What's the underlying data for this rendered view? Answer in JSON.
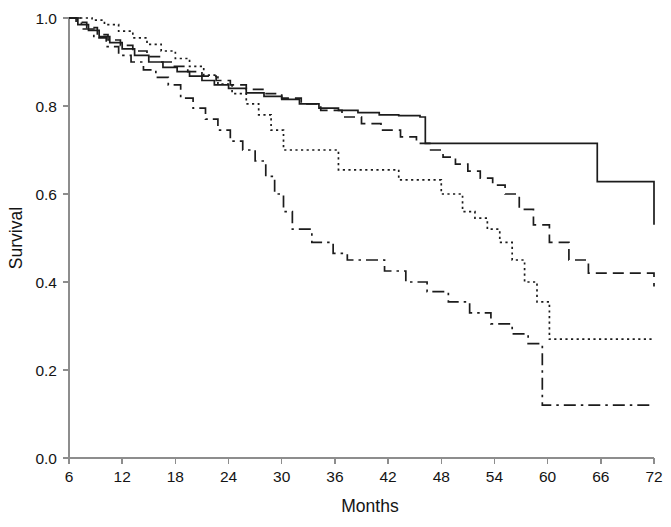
{
  "chart_data": {
    "type": "line",
    "title": "",
    "subtitle": "",
    "xlabel": "Months",
    "ylabel": "Survival",
    "xlim": [
      6,
      72
    ],
    "ylim": [
      0.0,
      1.0
    ],
    "xticks": [
      6,
      12,
      18,
      24,
      30,
      36,
      42,
      48,
      54,
      60,
      66,
      72
    ],
    "xticklabels": [
      "6",
      "12",
      "18",
      "24",
      "30",
      "36",
      "42",
      "48",
      "54",
      "60",
      "66",
      "72"
    ],
    "yticks": [
      0.0,
      0.2,
      0.4,
      0.6,
      0.8,
      1.0
    ],
    "yticklabels": [
      "0.0",
      "0.2",
      "0.4",
      "0.6",
      "0.8",
      "1.0"
    ],
    "grid": false,
    "legend": "none",
    "step_style": "post",
    "plot_kind": "kaplan-meier-survival",
    "series": [
      {
        "name": "Group 1",
        "linestyle": "solid",
        "color": "#1c1c1c",
        "final_value": 0.53,
        "x": [
          6,
          7.0,
          8.2,
          9.4,
          10.6,
          12.0,
          13.4,
          15.0,
          16.6,
          18.2,
          19.6,
          21.0,
          22.4,
          24.0,
          26.0,
          28.0,
          30.0,
          32.0,
          34.2,
          36.4,
          38.6,
          41.0,
          43.2,
          45.6,
          46.2,
          62.0,
          65.6,
          72.0
        ],
        "y": [
          1.0,
          0.985,
          0.972,
          0.958,
          0.944,
          0.93,
          0.915,
          0.9,
          0.888,
          0.878,
          0.868,
          0.858,
          0.848,
          0.84,
          0.83,
          0.822,
          0.815,
          0.805,
          0.795,
          0.79,
          0.785,
          0.78,
          0.778,
          0.775,
          0.715,
          0.715,
          0.628,
          0.53
        ]
      },
      {
        "name": "Group 2",
        "linestyle": "dashed",
        "color": "#1c1c1c",
        "final_value": 0.39,
        "x": [
          6,
          6.8,
          8.0,
          9.2,
          10.4,
          11.8,
          13.2,
          14.8,
          16.2,
          17.8,
          19.4,
          21.0,
          22.6,
          24.2,
          26.0,
          28.0,
          30.0,
          32.2,
          34.4,
          36.8,
          39.0,
          41.2,
          43.4,
          45.2,
          46.8,
          48.2,
          49.6,
          51.0,
          52.4,
          53.8,
          55.2,
          56.8,
          58.4,
          60.2,
          62.4,
          64.6,
          72.0
        ],
        "y": [
          1.0,
          0.99,
          0.978,
          0.962,
          0.95,
          0.938,
          0.925,
          0.912,
          0.9,
          0.89,
          0.878,
          0.868,
          0.858,
          0.848,
          0.838,
          0.828,
          0.818,
          0.805,
          0.79,
          0.775,
          0.76,
          0.745,
          0.73,
          0.715,
          0.7,
          0.684,
          0.668,
          0.652,
          0.636,
          0.62,
          0.6,
          0.565,
          0.53,
          0.49,
          0.45,
          0.42,
          0.39
        ]
      },
      {
        "name": "Group 3",
        "linestyle": "dotted",
        "color": "#1c1c1c",
        "final_value": 0.27,
        "x": [
          6,
          7.2,
          8.6,
          10.0,
          11.6,
          13.2,
          14.8,
          16.4,
          18.0,
          19.6,
          21.2,
          22.8,
          24.4,
          26.0,
          27.4,
          28.8,
          30.2,
          35.0,
          36.4,
          41.8,
          43.2,
          46.6,
          48.0,
          50.4,
          51.8,
          53.2,
          54.6,
          56.0,
          57.4,
          58.8,
          60.2,
          72.0
        ],
        "y": [
          1.0,
          1.0,
          0.995,
          0.985,
          0.97,
          0.955,
          0.94,
          0.925,
          0.908,
          0.89,
          0.87,
          0.85,
          0.828,
          0.805,
          0.78,
          0.745,
          0.7,
          0.7,
          0.655,
          0.655,
          0.632,
          0.632,
          0.6,
          0.56,
          0.545,
          0.52,
          0.49,
          0.45,
          0.4,
          0.355,
          0.27,
          0.27
        ]
      },
      {
        "name": "Group 4",
        "linestyle": "dashdot",
        "color": "#1c1c1c",
        "final_value": 0.12,
        "x": [
          6,
          7.4,
          8.8,
          10.2,
          11.6,
          13.0,
          14.4,
          15.8,
          17.2,
          18.6,
          20.0,
          21.4,
          22.8,
          24.2,
          25.6,
          27.0,
          28.2,
          29.2,
          30.2,
          31.2,
          33.4,
          35.8,
          37.4,
          39.0,
          41.6,
          44.0,
          46.4,
          48.8,
          51.2,
          53.6,
          56.0,
          57.8,
          59.4,
          72.0
        ],
        "y": [
          1.0,
          0.975,
          0.955,
          0.935,
          0.915,
          0.9,
          0.882,
          0.865,
          0.848,
          0.818,
          0.795,
          0.77,
          0.745,
          0.72,
          0.7,
          0.675,
          0.64,
          0.6,
          0.56,
          0.52,
          0.49,
          0.465,
          0.45,
          0.45,
          0.425,
          0.4,
          0.378,
          0.355,
          0.33,
          0.305,
          0.282,
          0.26,
          0.12,
          0.12
        ]
      }
    ]
  },
  "axes": {
    "y_axis_title": "Survival",
    "x_axis_title": "Months"
  }
}
